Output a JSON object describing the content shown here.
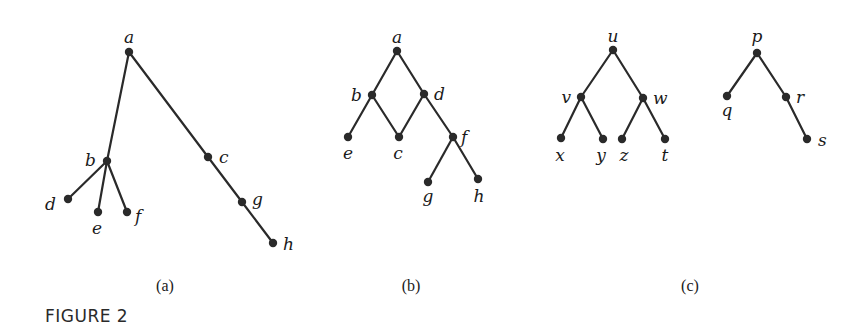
{
  "figure": {
    "caption": "FIGURE 2",
    "panels": [
      {
        "id": "a",
        "label": "(a)",
        "label_pos": [
          165,
          291
        ],
        "vertices": [
          {
            "name": "a",
            "x": 129,
            "y": 52,
            "lx": 129,
            "ly": 43,
            "anchor": "middle"
          },
          {
            "name": "b",
            "x": 107,
            "y": 161,
            "lx": 96,
            "ly": 166,
            "anchor": "end"
          },
          {
            "name": "c",
            "x": 208,
            "y": 157,
            "lx": 219,
            "ly": 163,
            "anchor": "start"
          },
          {
            "name": "d",
            "x": 68,
            "y": 199,
            "lx": 56,
            "ly": 210,
            "anchor": "end"
          },
          {
            "name": "e",
            "x": 98,
            "y": 212,
            "lx": 97,
            "ly": 234,
            "anchor": "middle"
          },
          {
            "name": "f",
            "x": 127,
            "y": 212,
            "lx": 135,
            "ly": 222,
            "anchor": "start"
          },
          {
            "name": "g",
            "x": 242,
            "y": 202,
            "lx": 252,
            "ly": 205,
            "anchor": "start"
          },
          {
            "name": "h",
            "x": 273,
            "y": 243,
            "lx": 283,
            "ly": 250,
            "anchor": "start"
          }
        ],
        "edges": [
          [
            "a",
            "b"
          ],
          [
            "a",
            "c"
          ],
          [
            "c",
            "g"
          ],
          [
            "g",
            "h"
          ],
          [
            "b",
            "d"
          ],
          [
            "b",
            "e"
          ],
          [
            "b",
            "f"
          ]
        ]
      },
      {
        "id": "b",
        "label": "(b)",
        "label_pos": [
          411,
          291
        ],
        "vertices": [
          {
            "name": "a",
            "x": 397,
            "y": 51,
            "lx": 397,
            "ly": 43,
            "anchor": "middle"
          },
          {
            "name": "b",
            "x": 372,
            "y": 95,
            "lx": 362,
            "ly": 101,
            "anchor": "end"
          },
          {
            "name": "d",
            "x": 424,
            "y": 94,
            "lx": 434,
            "ly": 100,
            "anchor": "start"
          },
          {
            "name": "e",
            "x": 348,
            "y": 137,
            "lx": 348,
            "ly": 159,
            "anchor": "middle"
          },
          {
            "name": "c",
            "x": 399,
            "y": 137,
            "lx": 398,
            "ly": 159,
            "anchor": "middle"
          },
          {
            "name": "f",
            "x": 453,
            "y": 137,
            "lx": 461,
            "ly": 143,
            "anchor": "start"
          },
          {
            "name": "g",
            "x": 428,
            "y": 182,
            "lx": 428,
            "ly": 202,
            "anchor": "middle"
          },
          {
            "name": "h",
            "x": 478,
            "y": 179,
            "lx": 479,
            "ly": 202,
            "anchor": "middle"
          }
        ],
        "edges": [
          [
            "a",
            "b"
          ],
          [
            "a",
            "d"
          ],
          [
            "b",
            "e"
          ],
          [
            "b",
            "c"
          ],
          [
            "d",
            "c"
          ],
          [
            "d",
            "f"
          ],
          [
            "f",
            "g"
          ],
          [
            "f",
            "h"
          ]
        ]
      },
      {
        "id": "c",
        "label": "(c)",
        "label_pos": [
          690,
          291
        ],
        "vertices": [
          {
            "name": "u",
            "x": 613,
            "y": 50,
            "lx": 613,
            "ly": 42,
            "anchor": "middle"
          },
          {
            "name": "v",
            "x": 581,
            "y": 97,
            "lx": 571,
            "ly": 103,
            "anchor": "end"
          },
          {
            "name": "w",
            "x": 643,
            "y": 98,
            "lx": 653,
            "ly": 104,
            "anchor": "start"
          },
          {
            "name": "x",
            "x": 561,
            "y": 138,
            "lx": 560,
            "ly": 161,
            "anchor": "middle"
          },
          {
            "name": "y",
            "x": 603,
            "y": 139,
            "lx": 601,
            "ly": 161,
            "anchor": "middle"
          },
          {
            "name": "z",
            "x": 622,
            "y": 139,
            "lx": 624,
            "ly": 161,
            "anchor": "middle"
          },
          {
            "name": "t",
            "x": 665,
            "y": 139,
            "lx": 665,
            "ly": 161,
            "anchor": "middle"
          },
          {
            "name": "p",
            "x": 757,
            "y": 53,
            "lx": 757,
            "ly": 42,
            "anchor": "middle"
          },
          {
            "name": "q",
            "x": 727,
            "y": 96,
            "lx": 727,
            "ly": 116,
            "anchor": "middle"
          },
          {
            "name": "r",
            "x": 786,
            "y": 97,
            "lx": 796,
            "ly": 103,
            "anchor": "start"
          },
          {
            "name": "s",
            "x": 807,
            "y": 139,
            "lx": 818,
            "ly": 146,
            "anchor": "start"
          }
        ],
        "edges": [
          [
            "u",
            "v"
          ],
          [
            "u",
            "w"
          ],
          [
            "v",
            "x"
          ],
          [
            "v",
            "y"
          ],
          [
            "w",
            "z"
          ],
          [
            "w",
            "t"
          ],
          [
            "p",
            "q"
          ],
          [
            "p",
            "r"
          ],
          [
            "r",
            "s"
          ]
        ]
      }
    ]
  }
}
